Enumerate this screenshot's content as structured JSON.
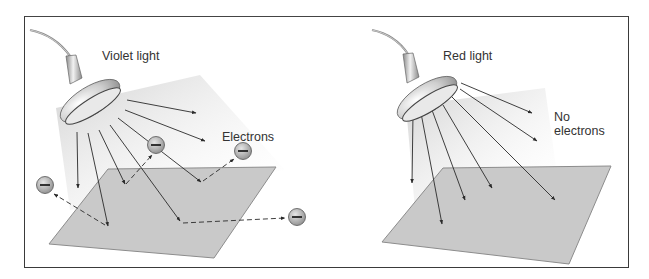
{
  "figure": {
    "panels": [
      {
        "id": "violet",
        "light_label": "Violet light",
        "result_label": "Electrons",
        "electron_symbol": "−",
        "electron_count": 4,
        "ray_color": "#2a2a2a",
        "beam_color": "#d8d8d8"
      },
      {
        "id": "red",
        "light_label": "Red light",
        "result_label": "No electrons",
        "electron_count": 0,
        "ray_color": "#2a2a2a",
        "beam_color": "#d8d8d8"
      }
    ],
    "colors": {
      "plate_fill": "#c9c9c9",
      "plate_edge": "#8c8c8c",
      "frame": "#3a3a3a",
      "electron_fill": "#a9a9a9",
      "text": "#333333"
    }
  }
}
